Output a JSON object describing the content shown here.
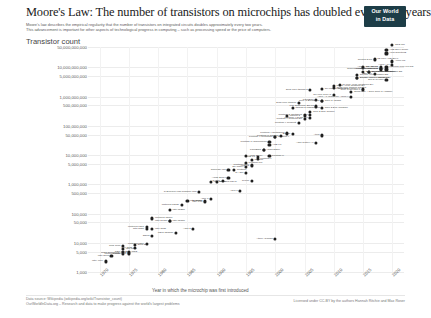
{
  "header": {
    "title": "Moore's Law: The number of transistors on microchips has doubled every two years",
    "subtitle_line1": "Moore's law describes the empirical regularity that the number of transistors on integrated circuits doubles approximately every two years.",
    "subtitle_line2": "This advancement is important for other aspects of technological progress in computing – such as processing speed or the price of computers.",
    "logo_line1": "Our World",
    "logo_line2": "in Data"
  },
  "footer": {
    "source": "Data source: Wikipedia (wikipedia.org/wiki/Transistor_count)",
    "site": "OurWorldInData.org – Research and data to make progress against the world's largest problems",
    "license": "Licensed under CC-BY by the authors Hannah Ritchie and Max Roser"
  },
  "chart_data": {
    "type": "scatter",
    "title": "Moore's Law: The number of transistors on microchips has doubled every two years",
    "ylabel": "Transistor count",
    "xlabel": "Year in which the microchip was first introduced",
    "yscale": "log",
    "ylim": [
      1000,
      50000000000
    ],
    "xlim": [
      1968,
      2022
    ],
    "grid": true,
    "legend": "none",
    "ytick_labels": [
      "50,000,000,000",
      "10,000,000,000",
      "5,000,000,000",
      "1,000,000,000",
      "500,000,000",
      "100,000,000",
      "50,000,000",
      "10,000,000",
      "5,000,000",
      "1,000,000",
      "500,000",
      "100,000",
      "50,000",
      "10,000",
      "5,000",
      "1,000"
    ],
    "ytick_values": [
      50000000000,
      10000000000,
      5000000000,
      1000000000,
      500000000,
      100000000,
      50000000,
      10000000,
      5000000,
      1000000,
      500000,
      100000,
      50000,
      10000,
      5000,
      1000
    ],
    "xtick_labels": [
      "1970",
      "1975",
      "1980",
      "1985",
      "1990",
      "1995",
      "2000",
      "2005",
      "2010",
      "2015",
      "2020"
    ],
    "xtick_values": [
      1970,
      1975,
      1980,
      1985,
      1990,
      1995,
      2000,
      2005,
      2010,
      2015,
      2020
    ],
    "points": [
      {
        "name": "Intel 4004",
        "year": 1971,
        "value": 2300,
        "side": "left"
      },
      {
        "name": "TMS 1000",
        "year": 1974,
        "value": 8000,
        "side": "left"
      },
      {
        "name": "Intel 8008",
        "year": 1972,
        "value": 3500,
        "side": "left"
      },
      {
        "name": "MOS Technology 6502",
        "year": 1975,
        "value": 4528,
        "side": "left"
      },
      {
        "name": "Motorola 6800",
        "year": 1974,
        "value": 4100,
        "side": "left"
      },
      {
        "name": "Intel 8080",
        "year": 1974,
        "value": 6000,
        "side": "right"
      },
      {
        "name": "RCA 1802",
        "year": 1974,
        "value": 5000,
        "side": "right"
      },
      {
        "name": "Zilog Z80",
        "year": 1976,
        "value": 8500,
        "side": "right"
      },
      {
        "name": "Intel 8085",
        "year": 1976,
        "value": 6500,
        "side": "left"
      },
      {
        "name": "Motorola 6809",
        "year": 1978,
        "value": 9000,
        "side": "left"
      },
      {
        "name": "Intel 8086",
        "year": 1978,
        "value": 29000,
        "side": "left"
      },
      {
        "name": "Intel 8088",
        "year": 1979,
        "value": 29000,
        "side": "right"
      },
      {
        "name": "Motorola 68000",
        "year": 1979,
        "value": 68000,
        "side": "right"
      },
      {
        "name": "Intel 80186",
        "year": 1982,
        "value": 55000,
        "side": "right"
      },
      {
        "name": "Intel 80286",
        "year": 1982,
        "value": 134000,
        "side": "right"
      },
      {
        "name": "WDC 65C816",
        "year": 1983,
        "value": 22000,
        "side": "left"
      },
      {
        "name": "Intel 80386",
        "year": 1985,
        "value": 275000,
        "side": "right"
      },
      {
        "name": "ARM 2",
        "year": 1986,
        "value": 30000,
        "side": "left"
      },
      {
        "name": "Motorola 68020",
        "year": 1984,
        "value": 190000,
        "side": "left"
      },
      {
        "name": "Intel i960",
        "year": 1988,
        "value": 250000,
        "side": "left"
      },
      {
        "name": "Intel 80486",
        "year": 1989,
        "value": 1180000,
        "side": "right"
      },
      {
        "name": "Motorola 68040",
        "year": 1990,
        "value": 1200000,
        "side": "right"
      },
      {
        "name": "ARM 3",
        "year": 1989,
        "value": 310000,
        "side": "left"
      },
      {
        "name": "R4000",
        "year": 1991,
        "value": 1350000,
        "side": "left"
      },
      {
        "name": "Pentium",
        "year": 1993,
        "value": 3100000,
        "side": "right"
      },
      {
        "name": "ARM 7",
        "year": 1994,
        "value": 578977,
        "side": "left"
      },
      {
        "name": "Pentium Pro",
        "year": 1995,
        "value": 5500000,
        "side": "right"
      },
      {
        "name": "AMD K5",
        "year": 1996,
        "value": 4300000,
        "side": "left"
      },
      {
        "name": "Pentium II",
        "year": 1997,
        "value": 7500000,
        "side": "right"
      },
      {
        "name": "AMD K6",
        "year": 1997,
        "value": 8800000,
        "side": "left"
      },
      {
        "name": "Pentium III",
        "year": 1999,
        "value": 9500000,
        "side": "right"
      },
      {
        "name": "AMD K7",
        "year": 1999,
        "value": 22000000,
        "side": "right"
      },
      {
        "name": "Pentium 4",
        "year": 2000,
        "value": 42000000,
        "side": "right"
      },
      {
        "name": "Atom",
        "year": 2008,
        "value": 47000000,
        "side": "left"
      },
      {
        "name": "Barton",
        "year": 2003,
        "value": 54300000,
        "side": "left"
      },
      {
        "name": "Itanium 2",
        "year": 2002,
        "value": 220000000,
        "side": "right"
      },
      {
        "name": "Itanium 2 Madison 6M",
        "year": 2003,
        "value": 410000000,
        "side": "right"
      },
      {
        "name": "Cell",
        "year": 2006,
        "value": 241000000,
        "side": "left"
      },
      {
        "name": "Core 2 Duo Conroe",
        "year": 2006,
        "value": 291000000,
        "side": "right"
      },
      {
        "name": "Core 2 Duo Wolfdale",
        "year": 2008,
        "value": 411000000,
        "side": "right"
      },
      {
        "name": "Core i7 (Quad)",
        "year": 2008,
        "value": 731000000,
        "side": "right"
      },
      {
        "name": "Six-core Xeon 7400",
        "year": 2008,
        "value": 1900000000,
        "side": "right"
      },
      {
        "name": "Dual-core Itanium 2",
        "year": 2006,
        "value": 1700000000,
        "side": "left"
      },
      {
        "name": "Quad-core Itanium Tukwila",
        "year": 2010,
        "value": 2000000000,
        "side": "right"
      },
      {
        "name": "8-core Xeon Nehalem-EX",
        "year": 2010,
        "value": 2300000000,
        "side": "right"
      },
      {
        "name": "10-core Xeon Westmere-EX",
        "year": 2011,
        "value": 2600000000,
        "side": "right"
      },
      {
        "name": "Six-core Core i7",
        "year": 2010,
        "value": 1170000000,
        "side": "left"
      },
      {
        "name": "Apple A7 (dual-core ARM64)",
        "year": 2013,
        "value": 1000000000,
        "side": "left"
      },
      {
        "name": "Quad-core + GPU Core i7 Haswell",
        "year": 2013,
        "value": 1400000000,
        "side": "right"
      },
      {
        "name": "8-core Xeon Ivy Bridge-EX",
        "year": 2014,
        "value": 4310000000,
        "side": "right"
      },
      {
        "name": "Xeon Broadwell-E5",
        "year": 2016,
        "value": 7200000000,
        "side": "right"
      },
      {
        "name": "15-core Xeon Ivy Bridge-EX",
        "year": 2014,
        "value": 4310000000,
        "side": "right"
      },
      {
        "name": "18-core Xeon Haswell-E5",
        "year": 2014,
        "value": 5560000000,
        "side": "right"
      },
      {
        "name": "22-core Xeon Broadwell-E5",
        "year": 2016,
        "value": 7200000000,
        "side": "right"
      },
      {
        "name": "IBM z13 Storage Controller",
        "year": 2015,
        "value": 7100000000,
        "side": "right"
      },
      {
        "name": "SPARC M7",
        "year": 2015,
        "value": 10000000000,
        "side": "right"
      },
      {
        "name": "IBM z14",
        "year": 2017,
        "value": 6100000000,
        "side": "left"
      },
      {
        "name": "32-core AMD Epyc",
        "year": 2017,
        "value": 19200000000,
        "side": "right"
      },
      {
        "name": "Apple A12X Bionic",
        "year": 2018,
        "value": 10000000000,
        "side": "left"
      },
      {
        "name": "Qualcomm Snapdragon 8cx",
        "year": 2018,
        "value": 8500000000,
        "side": "left"
      },
      {
        "name": "HiSilicon Kirin 990 5G",
        "year": 2019,
        "value": 10300000000,
        "side": "right"
      },
      {
        "name": "AWS Graviton2",
        "year": 2019,
        "value": 30000000000,
        "side": "right"
      },
      {
        "name": "Apple A13 (iPhone 11 Pro)",
        "year": 2019,
        "value": 8500000000,
        "side": "left"
      },
      {
        "name": "Apple M1",
        "year": 2020,
        "value": 16000000000,
        "side": "right"
      },
      {
        "name": "Apple A14",
        "year": 2020,
        "value": 11800000000,
        "side": "left"
      },
      {
        "name": "AMD Epyc Rome",
        "year": 2019,
        "value": 39540000000,
        "side": "right"
      },
      {
        "name": "GC2 IPU",
        "year": 2020,
        "value": 59400000000,
        "side": "right"
      },
      {
        "name": "Centriq 2400",
        "year": 2017,
        "value": 18000000000,
        "side": "left"
      },
      {
        "name": "Tegra Xavier SoC",
        "year": 2018,
        "value": 9000000000,
        "side": "left"
      },
      {
        "name": "Zen 2 (8-core)",
        "year": 2019,
        "value": 3800000000,
        "side": "left"
      },
      {
        "name": "Core i7 Skylake K",
        "year": 2015,
        "value": 1750000000,
        "side": "left"
      },
      {
        "name": "Core i7 Broadwell-U",
        "year": 2015,
        "value": 1900000000,
        "side": "left"
      },
      {
        "name": "Dual-core Itanium",
        "year": 2004,
        "value": 592000000,
        "side": "left"
      },
      {
        "name": "POWER6",
        "year": 2007,
        "value": 789000000,
        "side": "left"
      },
      {
        "name": "Core i7 Bloomfield",
        "year": 2008,
        "value": 731000000,
        "side": "left"
      },
      {
        "name": "K10 quad-core 2M L3",
        "year": 2007,
        "value": 463000000,
        "side": "left"
      },
      {
        "name": "Pentium D Smithfield",
        "year": 2005,
        "value": 228000000,
        "side": "left"
      },
      {
        "name": "Pentium 4 Prescott-2M",
        "year": 2005,
        "value": 169000000,
        "side": "left"
      },
      {
        "name": "Pentium 4 Cedar Mill",
        "year": 2006,
        "value": 184000000,
        "side": "left"
      },
      {
        "name": "Pentium 4 Prescott",
        "year": 2004,
        "value": 125000000,
        "side": "left"
      },
      {
        "name": "Pentium 4 Northwood",
        "year": 2002,
        "value": 55000000,
        "side": "left"
      },
      {
        "name": "Pentium 4 Willamette",
        "year": 2000,
        "value": 42000000,
        "side": "left"
      },
      {
        "name": "Pentium III Tualatin",
        "year": 2001,
        "value": 45000000,
        "side": "left"
      },
      {
        "name": "Pentium III Coppermine",
        "year": 1999,
        "value": 28100000,
        "side": "left"
      },
      {
        "name": "ARM Cortex-A9",
        "year": 2007,
        "value": 26000000,
        "side": "left"
      },
      {
        "name": "SA-110",
        "year": 1995,
        "value": 2500000,
        "side": "left"
      },
      {
        "name": "Pentium MMX",
        "year": 1996,
        "value": 4500000,
        "side": "left"
      },
      {
        "name": "R10000",
        "year": 1996,
        "value": 6800000,
        "side": "right"
      },
      {
        "name": "SPARC64",
        "year": 1995,
        "value": 3800000,
        "side": "left"
      },
      {
        "name": "Alpha 21164",
        "year": 1995,
        "value": 9300000,
        "side": "right"
      },
      {
        "name": "Alpha 21264",
        "year": 1998,
        "value": 15200000,
        "side": "right"
      },
      {
        "name": "POWER3",
        "year": 1998,
        "value": 15000000,
        "side": "left"
      },
      {
        "name": "R4700",
        "year": 1996,
        "value": 1350000,
        "side": "left"
      },
      {
        "name": "SuperSPARC",
        "year": 1992,
        "value": 3100000,
        "side": "left"
      },
      {
        "name": "Alpha 21064",
        "year": 1992,
        "value": 1680000,
        "side": "left"
      },
      {
        "name": "80386SX",
        "year": 1988,
        "value": 275000,
        "side": "left"
      },
      {
        "name": "TI Explorer Lisp machine chip",
        "year": 1987,
        "value": 553000,
        "side": "left"
      },
      {
        "name": "Intel 80186",
        "year": 1982,
        "value": 55000,
        "side": "left"
      },
      {
        "name": "Z8000",
        "year": 1979,
        "value": 17500,
        "side": "left"
      },
      {
        "name": "Intersil 6100",
        "year": 1975,
        "value": 4000,
        "side": "left"
      },
      {
        "name": "CDP 1801",
        "year": 1975,
        "value": 5000,
        "side": "left"
      },
      {
        "name": "Motorola 6801",
        "year": 1978,
        "value": 35000,
        "side": "left"
      },
      {
        "name": "Atmel ATmega",
        "year": 2000,
        "value": 14000,
        "side": "left"
      }
    ]
  }
}
